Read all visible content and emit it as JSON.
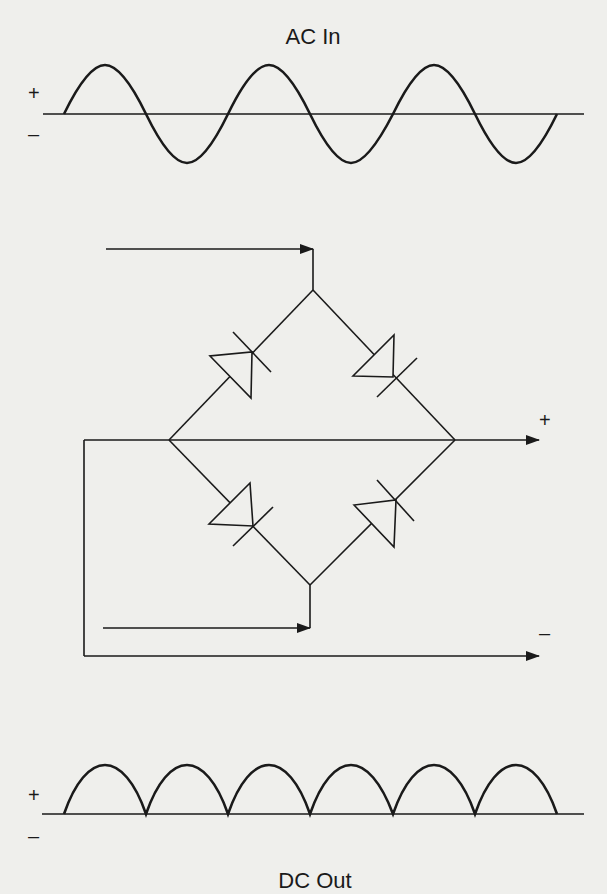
{
  "diagram": {
    "type": "full-wave bridge rectifier",
    "ac_input": {
      "title": "AC In",
      "plus_label": "+",
      "minus_label": "–",
      "waveform": "sine",
      "cycles": 3
    },
    "bridge": {
      "diodes": 4,
      "output_plus_label": "+",
      "output_minus_label": "–"
    },
    "dc_output": {
      "title": "DC Out",
      "plus_label": "+",
      "minus_label": "–",
      "waveform": "full-wave rectified",
      "humps": 6
    },
    "colors": {
      "line": "#1a1a1a",
      "background": "#efefec"
    }
  }
}
